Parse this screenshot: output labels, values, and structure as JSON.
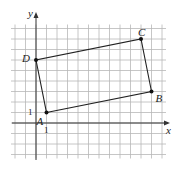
{
  "diagram": {
    "type": "coordinate-grid-quadrilateral",
    "axes": {
      "x_label": "x",
      "y_label": "y",
      "tick_x": "1",
      "tick_y": "1"
    },
    "grid": {
      "x_min": -2,
      "x_max": 12,
      "y_min": -3,
      "y_max": 9,
      "unit_px": 10.5,
      "origin_px": [
        36,
        123
      ]
    },
    "points": [
      {
        "name": "A",
        "x": 1,
        "y": 1
      },
      {
        "name": "B",
        "x": 11,
        "y": 3
      },
      {
        "name": "C",
        "x": 10,
        "y": 8
      },
      {
        "name": "D",
        "x": 0,
        "y": 6
      }
    ],
    "colors": {
      "grid": "#b8b8b8",
      "axis": "#333333",
      "shape": "#222222"
    }
  }
}
